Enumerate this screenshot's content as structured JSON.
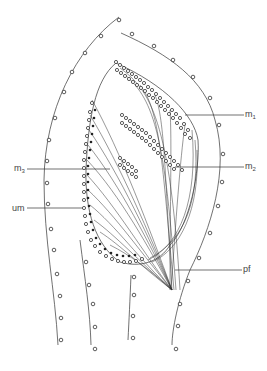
{
  "figure": {
    "type": "anatomical line diagram",
    "labels": {
      "m1": {
        "base": "m",
        "sub": "1"
      },
      "m2": {
        "base": "m",
        "sub": "2"
      },
      "m3": {
        "base": "m",
        "sub": "3"
      },
      "um": {
        "base": "um",
        "sub": ""
      },
      "pf": {
        "base": "pf",
        "sub": ""
      }
    },
    "colors": {
      "line": "#333333",
      "text": "#444444",
      "background": "#ffffff"
    }
  }
}
